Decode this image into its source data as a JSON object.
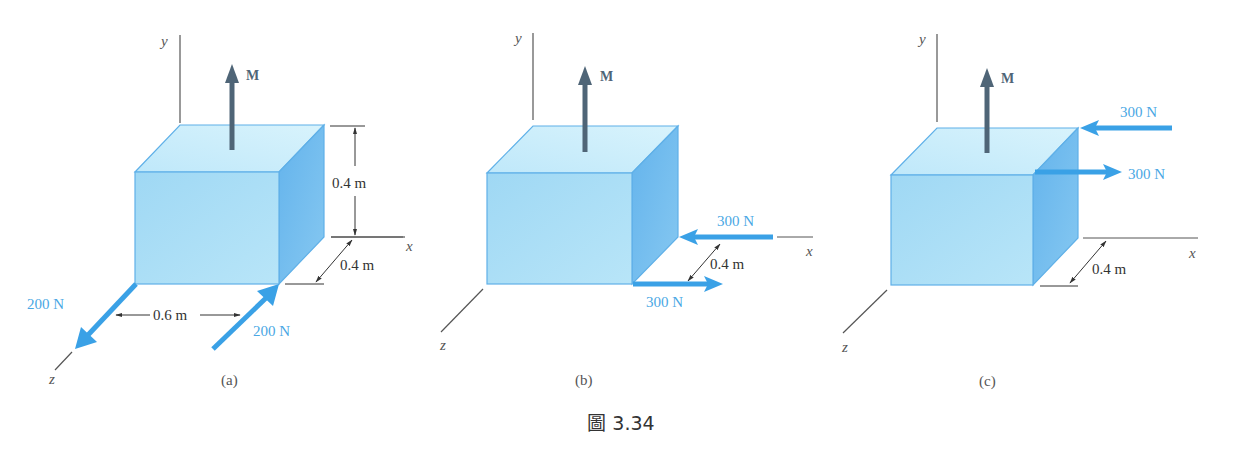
{
  "caption": "圖 3.34",
  "colors": {
    "front_face": "#a9ddf6",
    "top_face": "#cbeefb",
    "side_face": "#6fbaee",
    "edge": "#5fb0e8",
    "force_arrow": "#3aa1e6",
    "moment_arrow": "#4f6577",
    "axis": "#555555"
  },
  "panels": [
    {
      "id": "a",
      "label": "(a)",
      "axes": {
        "x": "x",
        "y": "y",
        "z": "z"
      },
      "moment": "M",
      "forces": [
        {
          "label": "200 N",
          "direction": "toward -z (outward)",
          "location": "front-left bottom edge"
        },
        {
          "label": "200 N",
          "direction": "toward +z (inward)",
          "location": "front-right bottom edge"
        }
      ],
      "dimensions": [
        "0.4 m",
        "0.4 m",
        "0.6 m"
      ]
    },
    {
      "id": "b",
      "label": "(b)",
      "axes": {
        "x": "x",
        "y": "y",
        "z": "z"
      },
      "moment": "M",
      "forces": [
        {
          "label": "300 N",
          "direction": "-x",
          "location": "back-right bottom corner"
        },
        {
          "label": "300 N",
          "direction": "+x",
          "location": "front-right bottom corner"
        }
      ],
      "dimensions": [
        "0.4 m"
      ]
    },
    {
      "id": "c",
      "label": "(c)",
      "axes": {
        "x": "x",
        "y": "y",
        "z": "z"
      },
      "moment": "M",
      "forces": [
        {
          "label": "300 N",
          "direction": "-x",
          "location": "back-right top corner"
        },
        {
          "label": "300 N",
          "direction": "+x",
          "location": "front-right top corner"
        }
      ],
      "dimensions": [
        "0.4 m"
      ]
    }
  ]
}
